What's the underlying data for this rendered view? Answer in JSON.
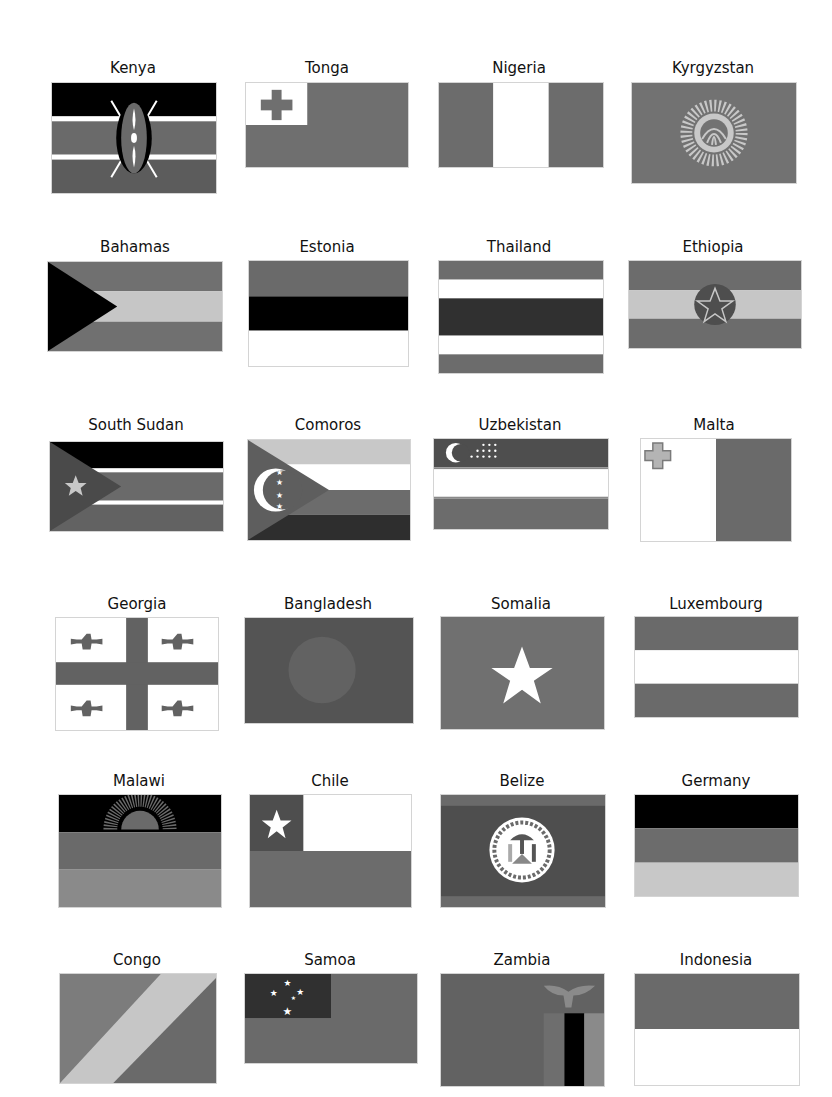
{
  "page": {
    "background": "#ffffff"
  },
  "colors": {
    "green": "#6b6b6b",
    "red": "#737373",
    "darkred": "#5a5a5a",
    "blue": "#555555",
    "lightblue": "#8a8a8a",
    "yellow": "#c8c8c8",
    "black": "#000000",
    "white": "#ffffff",
    "navy": "#3a3a3a"
  },
  "flags": [
    {
      "name": "Kenya"
    },
    {
      "name": "Tonga"
    },
    {
      "name": "Nigeria"
    },
    {
      "name": "Kyrgyzstan"
    },
    {
      "name": "Bahamas"
    },
    {
      "name": "Estonia"
    },
    {
      "name": "Thailand"
    },
    {
      "name": "Ethiopia"
    },
    {
      "name": "South Sudan"
    },
    {
      "name": "Comoros"
    },
    {
      "name": "Uzbekistan"
    },
    {
      "name": "Malta"
    },
    {
      "name": "Georgia"
    },
    {
      "name": "Bangladesh"
    },
    {
      "name": "Somalia"
    },
    {
      "name": "Luxembourg"
    },
    {
      "name": "Malawi"
    },
    {
      "name": "Chile"
    },
    {
      "name": "Belize"
    },
    {
      "name": "Germany"
    },
    {
      "name": "Congo"
    },
    {
      "name": "Samoa"
    },
    {
      "name": "Zambia"
    },
    {
      "name": "Indonesia"
    }
  ]
}
